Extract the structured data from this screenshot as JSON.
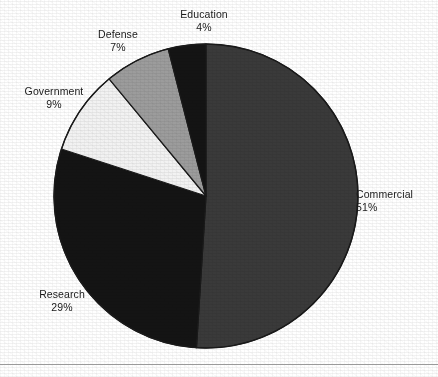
{
  "chart_data": {
    "type": "pie",
    "title": "",
    "subtitle": "",
    "xlabel": "",
    "ylabel": "",
    "legend_position": "none",
    "grid": false,
    "units": "percent",
    "start_angle_deg": 0,
    "direction": "clockwise",
    "categories": [
      "Commercial",
      "Research",
      "Government",
      "Defense",
      "Education"
    ],
    "values": [
      51,
      29,
      9,
      7,
      4
    ],
    "slices": [
      {
        "label": "Commercial",
        "percent_text": "51%",
        "value": 51,
        "color": "#3a3a3a",
        "start_deg": 0,
        "end_deg": 183.6
      },
      {
        "label": "Research",
        "percent_text": "29%",
        "value": 29,
        "color": "#141414",
        "start_deg": 183.6,
        "end_deg": 288.0
      },
      {
        "label": "Government",
        "percent_text": "9%",
        "value": 9,
        "color": "#f2f2f2",
        "start_deg": 288.0,
        "end_deg": 320.4
      },
      {
        "label": "Defense",
        "percent_text": "7%",
        "value": 7,
        "color": "#9c9c9c",
        "start_deg": 320.4,
        "end_deg": 345.6
      },
      {
        "label": "Education",
        "percent_text": "4%",
        "value": 4,
        "color": "#141414",
        "start_deg": 345.6,
        "end_deg": 360.0
      }
    ],
    "geometry": {
      "center_x": 206,
      "center_y": 196,
      "radius": 152
    },
    "stroke_color": "#1a1a1a",
    "background_color": "#ffffff"
  },
  "labels": {
    "education": {
      "name": "Education",
      "pct": "4%"
    },
    "defense": {
      "name": "Defense",
      "pct": "7%"
    },
    "government": {
      "name": "Government",
      "pct": "9%"
    },
    "research": {
      "name": "Research",
      "pct": "29%"
    },
    "commercial": {
      "name": "Commercial",
      "pct": "51%"
    }
  }
}
